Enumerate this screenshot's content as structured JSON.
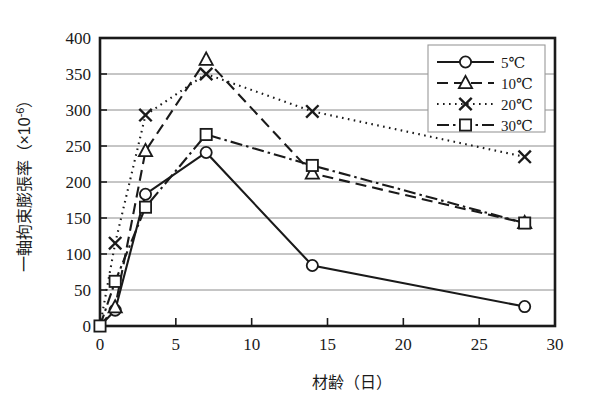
{
  "chart_data": {
    "type": "line",
    "title": "",
    "xlabel": "材齢（日）",
    "ylabel": "一軸拘束膨張率（×10⁻⁶）",
    "xlim": [
      0,
      30
    ],
    "ylim": [
      0,
      400
    ],
    "xticks": [
      "0",
      "5",
      "10",
      "15",
      "20",
      "25",
      "30"
    ],
    "yticks": [
      "0",
      "50",
      "100",
      "150",
      "200",
      "250",
      "300",
      "350",
      "400"
    ],
    "grid": "horizontal",
    "legend_position": "top-right",
    "x": [
      0,
      1,
      3,
      7,
      14,
      28
    ],
    "series": [
      {
        "name": "5℃",
        "marker": "circle",
        "linestyle": "solid",
        "color": "#1a1a1a",
        "values": [
          0,
          22,
          183,
          241,
          84,
          27
        ]
      },
      {
        "name": "10℃",
        "marker": "triangle",
        "linestyle": "dashed",
        "color": "#1a1a1a",
        "values": [
          0,
          26,
          243,
          370,
          212,
          143
        ]
      },
      {
        "name": "20℃",
        "marker": "cross",
        "linestyle": "dotted",
        "color": "#1a1a1a",
        "values": [
          0,
          115,
          293,
          350,
          298,
          235
        ]
      },
      {
        "name": "30℃",
        "marker": "square",
        "linestyle": "dashdot",
        "color": "#1a1a1a",
        "values": [
          0,
          62,
          165,
          266,
          223,
          143
        ]
      }
    ]
  },
  "legend": {
    "items": [
      {
        "label": "5℃"
      },
      {
        "label": "10℃"
      },
      {
        "label": "20℃"
      },
      {
        "label": "30℃"
      }
    ]
  },
  "axes": {
    "x_title": "材齢（日）",
    "y_title_main": "一軸拘束膨張率",
    "y_title_unit": "（×10",
    "y_title_exp": "-6",
    "y_title_close": "）"
  }
}
